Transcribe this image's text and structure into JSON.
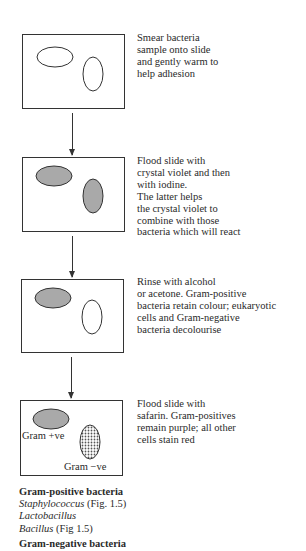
{
  "steps": [
    {
      "text": "Smear bacteria\nsample onto slide\nand gently warm to\nhelp adhesion",
      "slide_state": "unstained"
    },
    {
      "text": "Flood slide with\ncrystal violet and then\nwith iodine.\nThe latter helps\nthe crystal violet to\ncombine with those\nbacteria which will react",
      "slide_state": "both-stained"
    },
    {
      "text": "Rinse with alcohol\nor acetone. Gram-positive\nbacteria retain colour; eukaryotic\ncells and Gram-negative\nbacteria decolourise",
      "slide_state": "positive-stained"
    },
    {
      "text": "Flood slide with\nsafarin. Gram-positives\nremain purple; all other\ncells stain red",
      "slide_state": "counterstained"
    }
  ],
  "final_slide_labels": {
    "positive": "Gram +ve",
    "negative": "Gram −ve"
  },
  "examples": {
    "positive_heading": "Gram-positive bacteria",
    "positive_items": [
      {
        "name": "Staphylococcus",
        "ref": " (Fig. 1.5)"
      },
      {
        "name": "Lactobacillus",
        "ref": ""
      },
      {
        "name": "Bacillus",
        "ref": " (Fig 1.5)"
      }
    ],
    "negative_heading": "Gram-negative bacteria"
  },
  "colors": {
    "stain_fill": "#a9a9a9",
    "outline": "#333333"
  }
}
